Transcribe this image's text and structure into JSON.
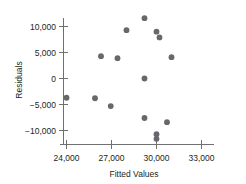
{
  "chart_data": {
    "type": "scatter",
    "title": "",
    "xlabel": "Fitted Values",
    "ylabel": "Residuals",
    "xlim": [
      23000,
      33800
    ],
    "ylim": [
      -13000,
      13000
    ],
    "grid": false,
    "legend": null,
    "xticks": [
      24000,
      27000,
      30000,
      33000
    ],
    "xtick_labels": [
      "24,000",
      "27,000",
      "30,000",
      "33,000"
    ],
    "yticks": [
      -10000,
      -5000,
      0,
      5000,
      10000
    ],
    "ytick_labels": [
      "−10,000",
      "−5,000",
      "0",
      "5,000",
      "10,000"
    ],
    "point_color": "#68686c",
    "axis_color": "#6f7072",
    "points": [
      {
        "x": 24000,
        "y": -3700
      },
      {
        "x": 25900,
        "y": -3800
      },
      {
        "x": 26300,
        "y": 4300
      },
      {
        "x": 26950,
        "y": -5300
      },
      {
        "x": 27400,
        "y": 3900
      },
      {
        "x": 28000,
        "y": 9300
      },
      {
        "x": 29200,
        "y": 11600
      },
      {
        "x": 29200,
        "y": 0
      },
      {
        "x": 29200,
        "y": -7600
      },
      {
        "x": 30000,
        "y": 9000
      },
      {
        "x": 30200,
        "y": 7900
      },
      {
        "x": 30000,
        "y": -10700
      },
      {
        "x": 30000,
        "y": -11600
      },
      {
        "x": 30700,
        "y": -8400
      },
      {
        "x": 31000,
        "y": 4100
      }
    ]
  },
  "axis": {
    "x_title": "Fitted Values",
    "y_title": "Residuals"
  }
}
